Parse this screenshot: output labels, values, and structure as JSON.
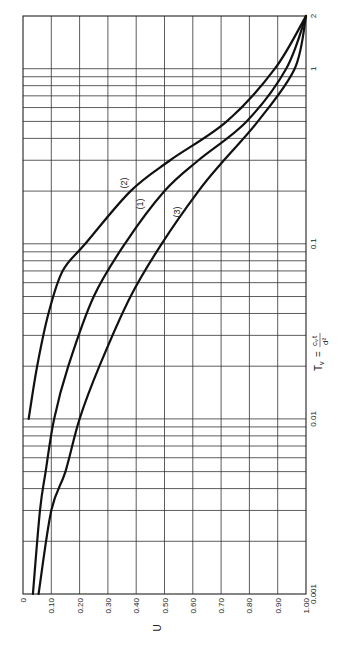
{
  "chart_data": {
    "type": "line",
    "title": "",
    "orientation": "rotated 90° counter-clockwise (U axis along bottom, Tv axis vertical, log scale)",
    "xlabel": "U",
    "ylabel": "T_v = c_v t / d²",
    "x_axis": {
      "label": "U",
      "range": [
        0,
        1.0
      ],
      "ticks": [
        "0",
        "0.10",
        "0.20",
        "0.30",
        "0.40",
        "0.50",
        "0.60",
        "0.70",
        "0.80",
        "0.90",
        "1.00"
      ]
    },
    "y_axis": {
      "label": "T_v = c_v t / d²",
      "scale": "log",
      "range": [
        0.001,
        2
      ],
      "ticks": [
        "0.001",
        "0.01",
        "0.1",
        "1",
        "2"
      ]
    },
    "grid": true,
    "legend": "inline curve labels",
    "series": [
      {
        "name": "(1)",
        "points": [
          [
            0.035,
            0.001
          ],
          [
            0.06,
            0.003
          ],
          [
            0.08,
            0.005
          ],
          [
            0.11,
            0.01
          ],
          [
            0.16,
            0.02
          ],
          [
            0.25,
            0.05
          ],
          [
            0.36,
            0.1
          ],
          [
            0.5,
            0.2
          ],
          [
            0.62,
            0.3
          ],
          [
            0.79,
            0.5
          ],
          [
            0.93,
            1.0
          ],
          [
            1.0,
            2.0
          ]
        ]
      },
      {
        "name": "(2)",
        "points": [
          [
            0.02,
            0.01
          ],
          [
            0.05,
            0.02
          ],
          [
            0.09,
            0.04
          ],
          [
            0.14,
            0.07
          ],
          [
            0.22,
            0.1
          ],
          [
            0.38,
            0.2
          ],
          [
            0.52,
            0.3
          ],
          [
            0.72,
            0.5
          ],
          [
            0.89,
            1.0
          ],
          [
            1.0,
            2.0
          ]
        ]
      },
      {
        "name": "(3)",
        "points": [
          [
            0.055,
            0.001
          ],
          [
            0.1,
            0.003
          ],
          [
            0.15,
            0.005
          ],
          [
            0.2,
            0.01
          ],
          [
            0.27,
            0.02
          ],
          [
            0.38,
            0.05
          ],
          [
            0.49,
            0.1
          ],
          [
            0.62,
            0.2
          ],
          [
            0.71,
            0.3
          ],
          [
            0.83,
            0.5
          ],
          [
            0.96,
            1.0
          ],
          [
            1.0,
            2.0
          ]
        ]
      }
    ],
    "annotations": [
      "(1)",
      "(2)",
      "(3)"
    ]
  },
  "labels": {
    "u_axis": "U",
    "tv_axis_prefix": "T",
    "tv_axis_sub": "v",
    "tv_axis_eq": "=",
    "tv_axis_num": "c",
    "tv_axis_num_sub": "v",
    "tv_axis_num_t": "t",
    "tv_axis_den": "d²",
    "curve1": "(1)",
    "curve2": "(2)",
    "curve3": "(3)",
    "u_ticks": [
      "0",
      "0.10",
      "0.20",
      "0.30",
      "0.40",
      "0.50",
      "0.60",
      "0.70",
      "0.80",
      "0.90",
      "1.00"
    ],
    "tv_ticks": [
      "0.001",
      "0.01",
      "0.1",
      "1",
      "2"
    ]
  }
}
